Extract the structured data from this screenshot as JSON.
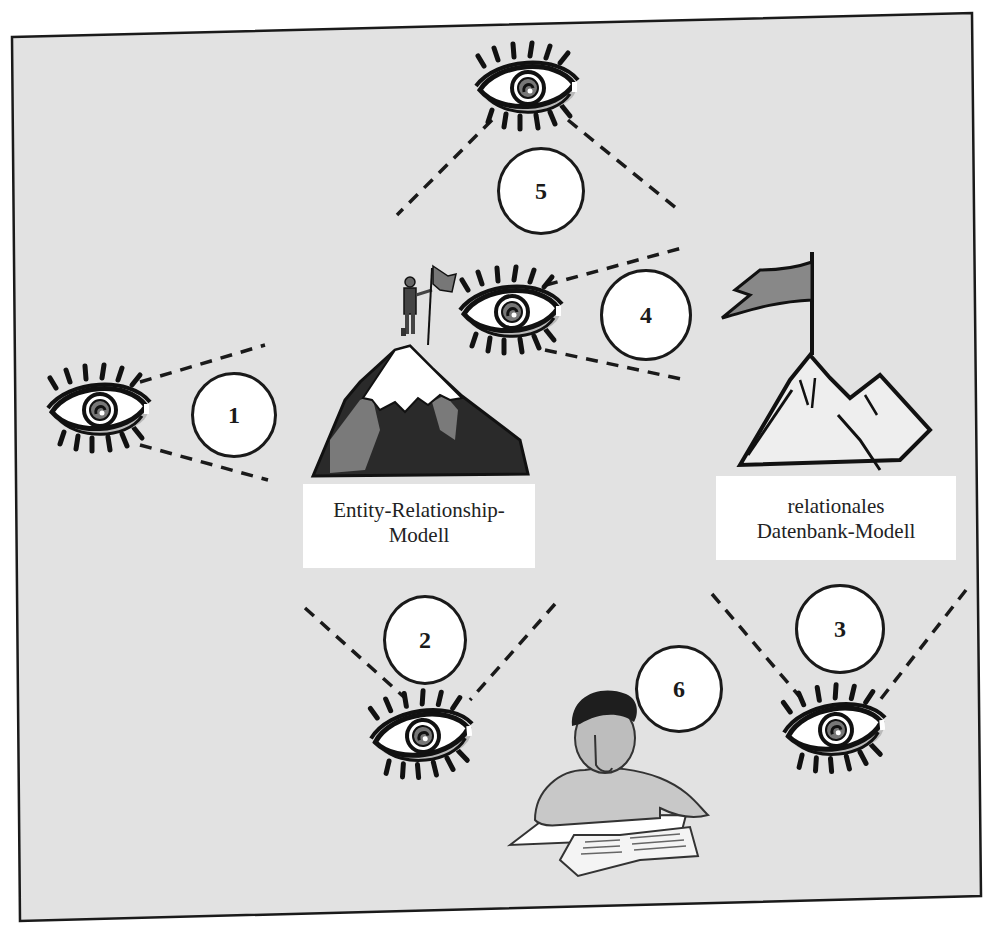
{
  "diagram": {
    "type": "conceptual-illustration",
    "background_color": "#e2e2e2",
    "border_color": "#1a1a1a",
    "nodes": [
      {
        "id": "er-model",
        "label_line1": "Entity-Relationship-",
        "label_line2": "Modell",
        "icon": "mountain-with-man-flag-icon"
      },
      {
        "id": "relational-model",
        "label_line1": "relationales",
        "label_line2": "Datenbank-Modell",
        "icon": "mountain-flag-icon"
      },
      {
        "id": "student",
        "icon": "student-reading-icon"
      }
    ],
    "steps": [
      {
        "number": "1",
        "observes": "er-model",
        "viewpoint": "eye-left"
      },
      {
        "number": "2",
        "observes": "er-model",
        "viewpoint": "eye-bottom-left"
      },
      {
        "number": "3",
        "observes": "relational-model",
        "viewpoint": "eye-bottom-right"
      },
      {
        "number": "4",
        "observes": "relational-model",
        "viewpoint": "eye-center"
      },
      {
        "number": "5",
        "observes": "er-model-and-relational",
        "viewpoint": "eye-top"
      },
      {
        "number": "6",
        "observes": "student",
        "viewpoint": "student"
      }
    ]
  }
}
